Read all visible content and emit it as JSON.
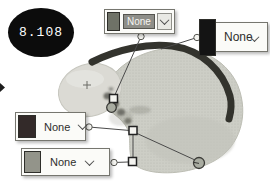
{
  "stage_badge": {
    "value": "8.108",
    "background": "#0c0c0c",
    "text_color": "#ffffff"
  },
  "selectors": [
    {
      "id": "top",
      "label": "None",
      "chip_color": "#6f7267",
      "state": "selected"
    },
    {
      "id": "right",
      "label": "None",
      "chip_color": "#141414",
      "state": "normal"
    },
    {
      "id": "mid_left",
      "label": "None",
      "chip_color": "#332a29",
      "state": "normal"
    },
    {
      "id": "bottom_left",
      "label": "None",
      "chip_color": "#93948a",
      "state": "normal"
    }
  ],
  "figure": {
    "colors": {
      "body": "#cdcec6",
      "body_dot": "#b9bab0",
      "left_lobe": "#dbdad4",
      "band": "#33332d",
      "stain": "#4b4b43",
      "leader_line": "#4a4a4a",
      "marker_fill": "#f4f4f0",
      "marker_stroke": "#222222",
      "circle_marker_fill": "#a9aca1"
    },
    "markers": [
      {
        "type": "square",
        "name": "marker-square-1"
      },
      {
        "type": "circle",
        "name": "marker-circle-1"
      },
      {
        "type": "square",
        "name": "marker-square-2"
      },
      {
        "type": "square",
        "name": "marker-square-3"
      },
      {
        "type": "circle",
        "name": "marker-circle-2"
      }
    ]
  }
}
